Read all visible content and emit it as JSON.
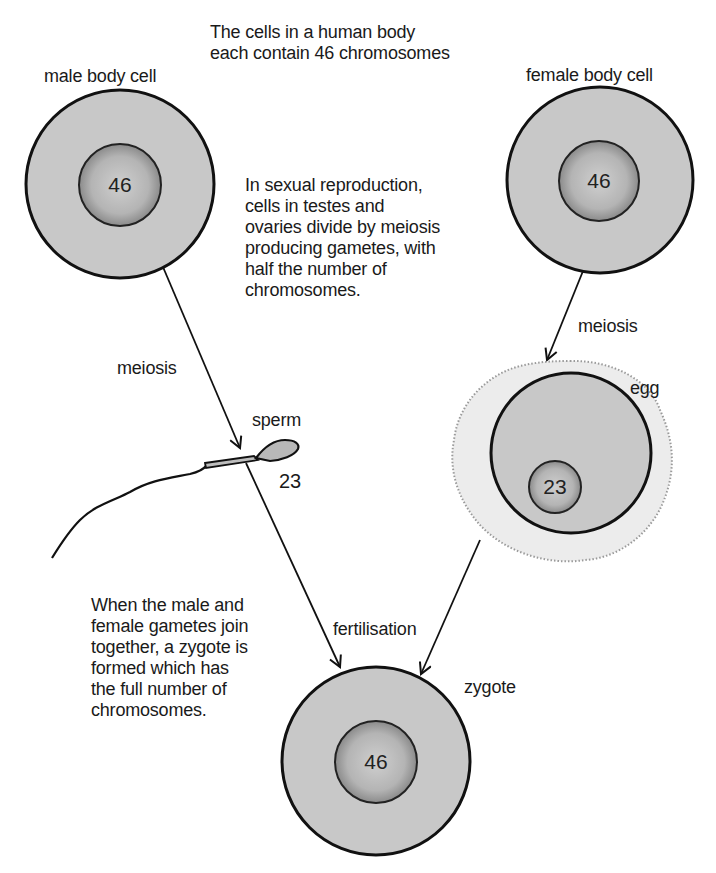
{
  "title": "The cells in a human body\neach contain 46 chromosomes",
  "labels": {
    "male_body_cell": "male body cell",
    "female_body_cell": "female body cell",
    "meiosis_male": "meiosis",
    "meiosis_female": "meiosis",
    "sperm": "sperm",
    "egg": "egg",
    "fertilisation": "fertilisation",
    "zygote": "zygote"
  },
  "chromosome_counts": {
    "male_body_cell": "46",
    "female_body_cell": "46",
    "sperm": "23",
    "egg": "23",
    "zygote": "46"
  },
  "paragraphs": {
    "meiosis_note": "In sexual reproduction,\ncells in testes and\novaries divide by meiosis\nproducing gametes, with\nhalf the number of\nchromosomes.",
    "fertilisation_note": "When the male and\nfemale gametes join\ntogether, a zygote is\nformed which has\nthe full number of\nchromosomes."
  },
  "colors": {
    "cytoplasm": "#c9c9c9",
    "nucleus": "#b0b0b0",
    "outline": "#111111",
    "egg_coat": "#e6e6e6"
  }
}
